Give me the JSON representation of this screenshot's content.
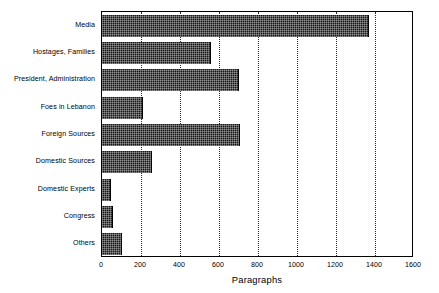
{
  "chart_data": {
    "type": "bar",
    "orientation": "horizontal",
    "title": "",
    "xlabel": "Paragraphs",
    "ylabel": "",
    "xlim": [
      0,
      1600
    ],
    "xticks": [
      0,
      200,
      400,
      600,
      800,
      1000,
      1200,
      1400,
      1600
    ],
    "xtick_labels": [
      "0",
      "200",
      "400",
      "600",
      "800",
      "1000",
      "1200",
      "1400",
      "1600"
    ],
    "grid": true,
    "grid_axis": "x",
    "grid_style": "dotted",
    "legend": null,
    "bar_color": "#161616",
    "bar_pattern": "dense-dither-stipple",
    "frame_color": "#000000",
    "background": "#ffffff",
    "categories": [
      "Media",
      "Hostages, Families",
      "President, Administration",
      "Foes in Lebanon",
      "Foreign Sources",
      "Domestic Sources",
      "Domestic Experts",
      "Congress",
      "Others"
    ],
    "values": [
      1370,
      560,
      700,
      210,
      710,
      255,
      45,
      55,
      105
    ]
  }
}
